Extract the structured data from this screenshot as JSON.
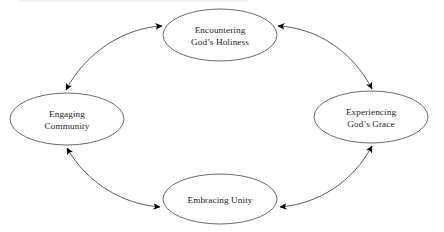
{
  "diagram": {
    "type": "cycle",
    "title": "",
    "background_color": "#ffffff",
    "node_stroke_color": "#5a5a5a",
    "connector_stroke_color": "#4a4a4a",
    "arrow_color": "#000000",
    "text_color": "#1d1d1d",
    "nodes": [
      {
        "id": "encountering-gods-holiness",
        "name": "node-encountering-gods-holiness",
        "position": "top",
        "line1": "Encountering",
        "line2": "God’s Holiness",
        "cx": 220,
        "cy": 35,
        "rx": 57,
        "ry": 26
      },
      {
        "id": "experiencing-gods-grace",
        "name": "node-experiencing-gods-grace",
        "position": "right",
        "line1": "Experiencing",
        "line2": "God’s Grace",
        "cx": 371,
        "cy": 117,
        "rx": 57,
        "ry": 26
      },
      {
        "id": "embracing-unity",
        "name": "node-embracing-unity",
        "position": "bottom",
        "line1": "Embracing Unity",
        "line2": "",
        "cx": 220,
        "cy": 199,
        "rx": 57,
        "ry": 25
      },
      {
        "id": "engaging-community",
        "name": "node-engaging-community",
        "position": "left",
        "line1": "Engaging",
        "line2": "Community",
        "cx": 67,
        "cy": 119,
        "rx": 57,
        "ry": 26
      }
    ],
    "connectors": [
      {
        "id": "connector-top-left",
        "name": "connector-engaging-community-encountering-gods-holiness",
        "from": "engaging-community",
        "to": "encountering-gods-holiness",
        "direction": "bidirectional"
      },
      {
        "id": "connector-top-right",
        "name": "connector-encountering-gods-holiness-experiencing-gods-grace",
        "from": "encountering-gods-holiness",
        "to": "experiencing-gods-grace",
        "direction": "bidirectional"
      },
      {
        "id": "connector-bottom-right",
        "name": "connector-experiencing-gods-grace-embracing-unity",
        "from": "experiencing-gods-grace",
        "to": "embracing-unity",
        "direction": "bidirectional"
      },
      {
        "id": "connector-bottom-left",
        "name": "connector-embracing-unity-engaging-community",
        "from": "embracing-unity",
        "to": "engaging-community",
        "direction": "bidirectional"
      }
    ]
  }
}
